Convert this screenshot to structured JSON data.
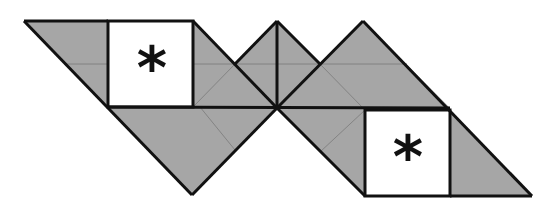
{
  "diagram": {
    "colors": {
      "fill_gray": "#a6a6a6",
      "fill_white": "#ffffff",
      "stroke": "#111111",
      "faint_line": "#7a7a7a"
    },
    "squares": [
      {
        "label": "*",
        "x": 108,
        "y": 21,
        "size": 85
      },
      {
        "label": "*",
        "x": 365,
        "y": 110,
        "size": 86
      }
    ]
  }
}
